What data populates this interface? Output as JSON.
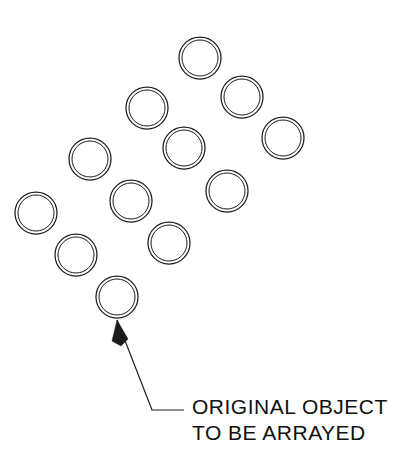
{
  "drawing": {
    "title": "Rectangular array of circles with callout",
    "background_color": "#ffffff",
    "line_color": "#1c1c1c",
    "canvas": {
      "width": 401,
      "height": 449
    },
    "object_shape": "double-ring-circle",
    "array": {
      "type": "rectangular",
      "rows": 4,
      "columns": 3,
      "count": 12,
      "rotation_degrees": -44,
      "row_spacing": 56,
      "column_spacing": 56,
      "circle_outer_radius": 21,
      "circle_inner_radius": 18,
      "original_object_index": 11,
      "circles": [
        {
          "label": "circle-1",
          "cx": 200,
          "cy": 58,
          "r_outer": 21,
          "r_inner": 18
        },
        {
          "label": "circle-2",
          "cx": 242,
          "cy": 97,
          "r_outer": 21,
          "r_inner": 18
        },
        {
          "label": "circle-3",
          "cx": 283,
          "cy": 138,
          "r_outer": 21,
          "r_inner": 18
        },
        {
          "label": "circle-4",
          "cx": 147,
          "cy": 108,
          "r_outer": 21,
          "r_inner": 18
        },
        {
          "label": "circle-5",
          "cx": 184,
          "cy": 148,
          "r_outer": 21,
          "r_inner": 18
        },
        {
          "label": "circle-6",
          "cx": 227,
          "cy": 191,
          "r_outer": 21,
          "r_inner": 18
        },
        {
          "label": "circle-7",
          "cx": 90,
          "cy": 159,
          "r_outer": 21,
          "r_inner": 18
        },
        {
          "label": "circle-8",
          "cx": 131,
          "cy": 201,
          "r_outer": 21,
          "r_inner": 18
        },
        {
          "label": "circle-9",
          "cx": 169,
          "cy": 243,
          "r_outer": 21,
          "r_inner": 18
        },
        {
          "label": "circle-10",
          "cx": 36,
          "cy": 213,
          "r_outer": 21,
          "r_inner": 18
        },
        {
          "label": "circle-11",
          "cx": 76,
          "cy": 255,
          "r_outer": 21,
          "r_inner": 18
        },
        {
          "label": "circle-12",
          "cx": 117,
          "cy": 297,
          "r_outer": 21,
          "r_inner": 18
        }
      ]
    },
    "callout": {
      "line1": "ORIGINAL  OBJECT",
      "line2": "TO BE ARRAYED",
      "text_x": 192,
      "line1_y": 414,
      "line2_y": 440,
      "font_size": 21,
      "leader": {
        "arrow_tip_x": 117,
        "arrow_tip_y": 320,
        "elbow_x": 152,
        "elbow_y": 410,
        "end_x": 184,
        "end_y": 410,
        "arrow_base_left_x": 112,
        "arrow_base_left_y": 341,
        "arrow_base_right_x": 128,
        "arrow_base_right_y": 339
      }
    }
  }
}
